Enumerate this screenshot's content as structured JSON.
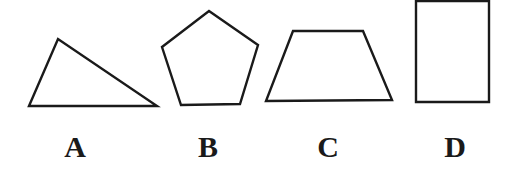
{
  "diagram": {
    "shapes": [
      {
        "label": "A",
        "type": "triangle",
        "points": "29,106 58,39 157,106"
      },
      {
        "label": "B",
        "type": "pentagon",
        "points": "209,11 258,45 240,104 181,105 162,47"
      },
      {
        "label": "C",
        "type": "trapezoid",
        "points": "293,31 363,31 392,100 266,101"
      },
      {
        "label": "D",
        "type": "rectangle",
        "points": "416,1 489,1 489,102 416,102"
      }
    ]
  }
}
